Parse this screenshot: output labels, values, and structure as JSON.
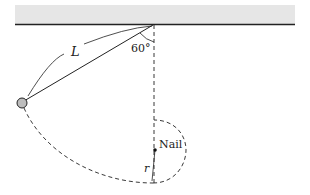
{
  "diagram": {
    "labels": {
      "length": "L",
      "angle": "60°",
      "nail": "Nail",
      "radius": "r"
    },
    "colors": {
      "ceiling_fill": "#e6e6e6",
      "ceiling_edge": "#222222",
      "line": "#222222",
      "bob_fill": "#bdbdbd"
    },
    "geometry": {
      "pivot": [
        153,
        25
      ],
      "bob": [
        22,
        103
      ],
      "nail": [
        155,
        150
      ],
      "lowest_point": [
        153,
        183
      ],
      "angle_deg": 60
    }
  }
}
